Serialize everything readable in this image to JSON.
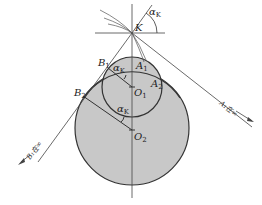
{
  "diagram": {
    "title": "",
    "colors": {
      "circle_fill": "#c8c8c8",
      "stroke": "#333333",
      "background": "#ffffff"
    },
    "points": {
      "K": {
        "label": "K"
      },
      "A1": {
        "label": "A",
        "sub": "1"
      },
      "A2": {
        "label": "A",
        "sub": "2"
      },
      "B1": {
        "label": "B",
        "sub": "1"
      },
      "B2": {
        "label": "B",
        "sub": "2"
      },
      "O1": {
        "label": "O",
        "sub": "1"
      },
      "O2": {
        "label": "O",
        "sub": "2"
      }
    },
    "angles": {
      "top": {
        "label": "α",
        "sub": "K"
      },
      "circle1": {
        "label": "α",
        "sub": "K"
      },
      "circle2": {
        "label": "α",
        "sub": "K"
      }
    },
    "annotations": {
      "A1_infinity": "A₁在∞",
      "B1_infinity": "B₁在∞"
    }
  }
}
